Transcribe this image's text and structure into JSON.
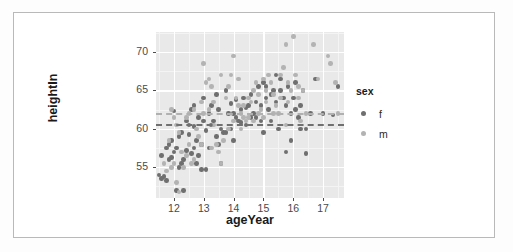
{
  "chart_data": {
    "type": "scatter",
    "title": "",
    "xlabel": "ageYear",
    "ylabel": "heightIn",
    "xlim": [
      11.4,
      17.7
    ],
    "ylim": [
      51.0,
      72.6
    ],
    "xticks": [
      12,
      13,
      14,
      15,
      16,
      17
    ],
    "yticks": [
      55,
      60,
      65,
      70
    ],
    "xtick_labels": [
      "12",
      "13",
      "14",
      "15",
      "16",
      "17"
    ],
    "ytick_labels": [
      "55",
      "60",
      "65",
      "70"
    ],
    "grid": true,
    "grid_major_color": "#ffffff",
    "grid_minor_color": "#f4f4f4",
    "panel_background": "#e9e9e9",
    "legend": {
      "title": "sex",
      "position": "right",
      "entries": [
        {
          "label": "f",
          "color": "#6f6f6f"
        },
        {
          "label": "m",
          "color": "#b3b3b3"
        }
      ]
    },
    "reference_lines": [
      {
        "y": 62.1,
        "style": "dashed",
        "color": "#b0b0b0",
        "group": "m"
      },
      {
        "y": 60.6,
        "style": "dashed",
        "color": "#707070",
        "group": "f"
      }
    ],
    "series": [
      {
        "name": "f",
        "color": "#6f6f6f",
        "points": [
          [
            11.92,
            56.3
          ],
          [
            12.0,
            62.3
          ],
          [
            12.08,
            57.5
          ],
          [
            12.17,
            59.0
          ],
          [
            11.58,
            56.5
          ],
          [
            11.75,
            53.3
          ],
          [
            11.67,
            53.8
          ],
          [
            12.42,
            57.2
          ],
          [
            12.5,
            59.3
          ],
          [
            12.58,
            56.8
          ],
          [
            11.83,
            58.0
          ],
          [
            12.25,
            55.5
          ],
          [
            12.33,
            56.0
          ],
          [
            12.67,
            60.3
          ],
          [
            12.75,
            58.5
          ],
          [
            12.83,
            61.5
          ],
          [
            13.0,
            61.0
          ],
          [
            13.08,
            59.8
          ],
          [
            13.17,
            62.0
          ],
          [
            12.92,
            54.7
          ],
          [
            13.25,
            63.0
          ],
          [
            13.33,
            61.0
          ],
          [
            13.42,
            64.5
          ],
          [
            13.5,
            62.5
          ],
          [
            13.58,
            60.0
          ],
          [
            13.67,
            59.5
          ],
          [
            13.75,
            65.0
          ],
          [
            13.83,
            62.0
          ],
          [
            13.92,
            63.3
          ],
          [
            14.0,
            62.0
          ],
          [
            14.08,
            63.8
          ],
          [
            14.17,
            61.0
          ],
          [
            14.25,
            62.5
          ],
          [
            14.33,
            64.0
          ],
          [
            14.42,
            60.5
          ],
          [
            14.5,
            63.0
          ],
          [
            14.58,
            64.5
          ],
          [
            14.67,
            62.0
          ],
          [
            14.75,
            61.5
          ],
          [
            14.83,
            65.5
          ],
          [
            14.92,
            63.0
          ],
          [
            15.0,
            66.0
          ],
          [
            15.08,
            64.0
          ],
          [
            15.17,
            62.5
          ],
          [
            15.25,
            61.0
          ],
          [
            15.33,
            65.0
          ],
          [
            15.42,
            63.5
          ],
          [
            15.5,
            60.0
          ],
          [
            15.58,
            66.5
          ],
          [
            15.67,
            64.0
          ],
          [
            15.75,
            57.0
          ],
          [
            15.83,
            65.5
          ],
          [
            15.92,
            58.5
          ],
          [
            16.0,
            64.0
          ],
          [
            16.08,
            66.0
          ],
          [
            16.17,
            61.5
          ],
          [
            16.25,
            60.0
          ],
          [
            16.33,
            65.0
          ],
          [
            16.42,
            56.8
          ],
          [
            16.58,
            62.0
          ],
          [
            16.75,
            66.5
          ],
          [
            17.0,
            62.0
          ],
          [
            17.33,
            61.8
          ],
          [
            17.5,
            65.5
          ],
          [
            11.5,
            54.0
          ],
          [
            11.58,
            53.5
          ],
          [
            12.08,
            52.0
          ],
          [
            12.33,
            52.0
          ],
          [
            12.17,
            55.0
          ],
          [
            12.0,
            57.0
          ],
          [
            11.92,
            58.5
          ],
          [
            12.25,
            59.5
          ],
          [
            12.42,
            61.0
          ],
          [
            12.58,
            62.5
          ],
          [
            12.67,
            57.5
          ],
          [
            12.75,
            55.5
          ],
          [
            12.83,
            56.5
          ],
          [
            12.92,
            58.0
          ],
          [
            13.08,
            54.7
          ],
          [
            13.17,
            57.5
          ],
          [
            13.25,
            60.5
          ],
          [
            13.42,
            59.0
          ],
          [
            13.58,
            55.5
          ],
          [
            13.75,
            59.5
          ],
          [
            13.92,
            60.0
          ],
          [
            14.08,
            61.5
          ],
          [
            14.25,
            60.8
          ],
          [
            14.42,
            62.8
          ],
          [
            14.58,
            61.5
          ],
          [
            14.75,
            63.5
          ],
          [
            14.92,
            61.0
          ],
          [
            15.08,
            65.5
          ],
          [
            15.25,
            64.5
          ],
          [
            15.42,
            67.0
          ],
          [
            15.58,
            65.0
          ],
          [
            15.75,
            63.0
          ],
          [
            15.92,
            62.0
          ],
          [
            16.08,
            62.5
          ],
          [
            16.25,
            63.0
          ],
          [
            16.42,
            60.0
          ],
          [
            12.5,
            60.5
          ],
          [
            13.5,
            58.0
          ],
          [
            14.0,
            58.5
          ],
          [
            15.0,
            59.5
          ],
          [
            11.83,
            56.0
          ],
          [
            11.75,
            57.5
          ],
          [
            12.67,
            63.0
          ],
          [
            13.0,
            64.0
          ]
        ]
      },
      {
        "name": "m",
        "color": "#b3b3b3",
        "points": [
          [
            12.08,
            53.0
          ],
          [
            12.17,
            51.8
          ],
          [
            12.33,
            55.0
          ],
          [
            12.42,
            56.5
          ],
          [
            11.92,
            55.0
          ],
          [
            12.0,
            55.5
          ],
          [
            12.25,
            57.0
          ],
          [
            12.5,
            58.0
          ],
          [
            12.58,
            55.5
          ],
          [
            12.67,
            62.5
          ],
          [
            12.75,
            60.0
          ],
          [
            12.83,
            59.0
          ],
          [
            12.92,
            58.0
          ],
          [
            13.0,
            68.5
          ],
          [
            13.08,
            66.0
          ],
          [
            13.17,
            66.5
          ],
          [
            13.25,
            65.5
          ],
          [
            13.33,
            60.5
          ],
          [
            13.42,
            58.0
          ],
          [
            13.5,
            57.0
          ],
          [
            13.58,
            55.5
          ],
          [
            13.67,
            58.5
          ],
          [
            13.75,
            64.0
          ],
          [
            13.83,
            65.5
          ],
          [
            13.92,
            67.0
          ],
          [
            14.0,
            69.5
          ],
          [
            14.08,
            64.0
          ],
          [
            14.17,
            63.0
          ],
          [
            14.25,
            62.0
          ],
          [
            14.33,
            61.5
          ],
          [
            14.42,
            61.0
          ],
          [
            14.5,
            61.5
          ],
          [
            14.58,
            63.5
          ],
          [
            14.67,
            65.0
          ],
          [
            14.75,
            66.0
          ],
          [
            14.83,
            64.5
          ],
          [
            14.92,
            62.5
          ],
          [
            15.0,
            66.5
          ],
          [
            15.08,
            65.0
          ],
          [
            15.17,
            67.0
          ],
          [
            15.25,
            66.0
          ],
          [
            15.33,
            64.5
          ],
          [
            15.42,
            63.0
          ],
          [
            15.5,
            62.0
          ],
          [
            15.58,
            67.0
          ],
          [
            15.67,
            68.0
          ],
          [
            15.75,
            71.0
          ],
          [
            15.83,
            66.0
          ],
          [
            15.92,
            65.0
          ],
          [
            16.0,
            72.0
          ],
          [
            16.08,
            67.0
          ],
          [
            16.17,
            65.5
          ],
          [
            16.33,
            65.0
          ],
          [
            16.42,
            62.0
          ],
          [
            16.67,
            71.0
          ],
          [
            16.83,
            66.5
          ],
          [
            17.17,
            69.5
          ],
          [
            17.25,
            68.5
          ],
          [
            17.42,
            66.0
          ],
          [
            17.5,
            62.0
          ],
          [
            11.67,
            55.5
          ],
          [
            11.75,
            54.5
          ],
          [
            11.83,
            58.5
          ],
          [
            12.17,
            59.5
          ],
          [
            12.42,
            61.5
          ],
          [
            12.67,
            56.0
          ],
          [
            12.92,
            63.5
          ],
          [
            13.17,
            62.5
          ],
          [
            13.33,
            63.5
          ],
          [
            13.58,
            67.0
          ],
          [
            13.83,
            60.0
          ],
          [
            14.17,
            66.5
          ],
          [
            14.33,
            63.0
          ],
          [
            14.5,
            64.0
          ],
          [
            14.67,
            61.0
          ],
          [
            14.83,
            62.0
          ],
          [
            15.08,
            63.5
          ],
          [
            15.33,
            62.0
          ],
          [
            15.58,
            64.0
          ],
          [
            15.83,
            63.5
          ],
          [
            16.17,
            64.0
          ],
          [
            16.25,
            61.0
          ],
          [
            13.0,
            62.0
          ],
          [
            13.25,
            57.5
          ],
          [
            12.08,
            60.5
          ],
          [
            12.0,
            61.5
          ],
          [
            11.92,
            62.5
          ],
          [
            12.5,
            62.0
          ],
          [
            14.0,
            61.0
          ],
          [
            14.25,
            60.0
          ],
          [
            15.0,
            61.5
          ],
          [
            15.75,
            60.5
          ]
        ]
      }
    ]
  }
}
